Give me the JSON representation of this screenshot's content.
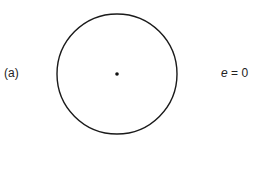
{
  "figure": {
    "panel_label": "(a)",
    "eccentricity": {
      "variable": "e",
      "equals": " = ",
      "value": "0"
    },
    "shape": {
      "type": "circle",
      "center": [
        117,
        74
      ],
      "radius": 60,
      "stroke": "#1a1a1a",
      "focus_dot": true
    }
  }
}
